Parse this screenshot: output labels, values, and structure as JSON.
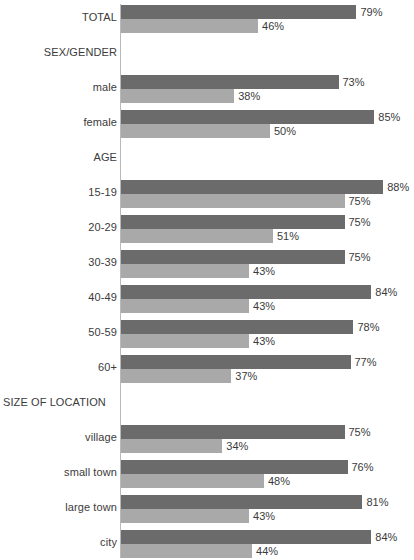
{
  "chart": {
    "type": "bar",
    "orientation": "horizontal",
    "axis_origin_x_px": 120,
    "px_per_percent": 2.98
  },
  "chart_data": {
    "type": "bar",
    "title": "",
    "subtitle": "",
    "xlabel": "",
    "ylabel": "",
    "xlim": [
      0,
      100
    ],
    "grid": false,
    "legend": null,
    "value_suffix": "%",
    "orientation": "horizontal",
    "categories": [
      "TOTAL",
      "SEX/GENDER",
      "male",
      "female",
      "AGE",
      "15-19",
      "20-29",
      "30-39",
      "40-49",
      "50-59",
      "60+",
      "SIZE OF LOCATION",
      "village",
      "small town",
      "large town",
      "city"
    ],
    "series": [
      {
        "name": "series-1",
        "color": "#6b6b6b",
        "values": [
          79,
          null,
          73,
          85,
          null,
          88,
          75,
          75,
          84,
          78,
          77,
          null,
          75,
          76,
          81,
          84
        ]
      },
      {
        "name": "series-2",
        "color": "#a9a9a9",
        "values": [
          46,
          null,
          38,
          50,
          null,
          75,
          51,
          43,
          43,
          43,
          37,
          null,
          34,
          48,
          43,
          44
        ]
      }
    ]
  },
  "rows": [
    {
      "label": "TOTAL",
      "kind": "data",
      "align": "right",
      "upper": {
        "value": 79,
        "label": "79%"
      },
      "lower": {
        "value": 46,
        "label": "46%"
      }
    },
    {
      "label": "SEX/GENDER",
      "kind": "section",
      "align": "right",
      "upper": null,
      "lower": null
    },
    {
      "label": "male",
      "kind": "data",
      "align": "right",
      "upper": {
        "value": 73,
        "label": "73%"
      },
      "lower": {
        "value": 38,
        "label": "38%"
      }
    },
    {
      "label": "female",
      "kind": "data",
      "align": "right",
      "upper": {
        "value": 85,
        "label": "85%"
      },
      "lower": {
        "value": 50,
        "label": "50%"
      }
    },
    {
      "label": "AGE",
      "kind": "section",
      "align": "right",
      "upper": null,
      "lower": null
    },
    {
      "label": "15-19",
      "kind": "data",
      "align": "right",
      "upper": {
        "value": 88,
        "label": "88%"
      },
      "lower": {
        "value": 75,
        "label": "75%"
      }
    },
    {
      "label": "20-29",
      "kind": "data",
      "align": "right",
      "upper": {
        "value": 75,
        "label": "75%"
      },
      "lower": {
        "value": 51,
        "label": "51%"
      }
    },
    {
      "label": "30-39",
      "kind": "data",
      "align": "right",
      "upper": {
        "value": 75,
        "label": "75%"
      },
      "lower": {
        "value": 43,
        "label": "43%"
      }
    },
    {
      "label": "40-49",
      "kind": "data",
      "align": "right",
      "upper": {
        "value": 84,
        "label": "84%"
      },
      "lower": {
        "value": 43,
        "label": "43%"
      }
    },
    {
      "label": "50-59",
      "kind": "data",
      "align": "right",
      "upper": {
        "value": 78,
        "label": "78%"
      },
      "lower": {
        "value": 43,
        "label": "43%"
      }
    },
    {
      "label": "60+",
      "kind": "data",
      "align": "right",
      "upper": {
        "value": 77,
        "label": "77%"
      },
      "lower": {
        "value": 37,
        "label": "37%"
      }
    },
    {
      "label": "SIZE OF LOCATION",
      "kind": "section",
      "align": "left",
      "upper": null,
      "lower": null
    },
    {
      "label": "village",
      "kind": "data",
      "align": "right",
      "upper": {
        "value": 75,
        "label": "75%"
      },
      "lower": {
        "value": 34,
        "label": "34%"
      }
    },
    {
      "label": "small town",
      "kind": "data",
      "align": "right",
      "upper": {
        "value": 76,
        "label": "76%"
      },
      "lower": {
        "value": 48,
        "label": "48%"
      }
    },
    {
      "label": "large town",
      "kind": "data",
      "align": "right",
      "upper": {
        "value": 81,
        "label": "81%"
      },
      "lower": {
        "value": 43,
        "label": "43%"
      }
    },
    {
      "label": "city",
      "kind": "data",
      "align": "right",
      "upper": {
        "value": 84,
        "label": "84%"
      },
      "lower": {
        "value": 44,
        "label": "44%"
      }
    }
  ]
}
